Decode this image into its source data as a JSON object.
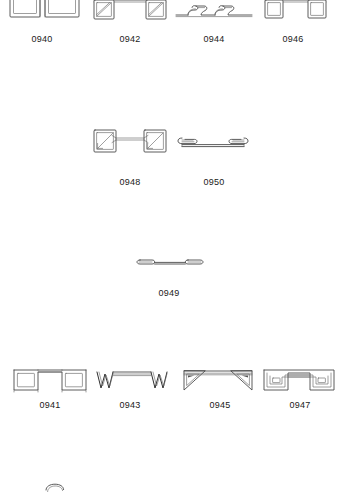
{
  "page": {
    "background_color": "#ffffff",
    "line_color": "#4a4a4a",
    "label_color": "#1a1a1a",
    "kind": "technical parts illustration sheet"
  },
  "rows": [
    {
      "row_name": "row-1",
      "figures": [
        {
          "id": "0940",
          "label": "0940",
          "icon": "double-rectangle-frame-bracket",
          "x": 8,
          "y": 0,
          "w": 70,
          "h": 22,
          "label_x": 20,
          "label_y": 34
        },
        {
          "id": "0942",
          "label": "0942",
          "icon": "diagonal-corner-brace-pair",
          "x": 92,
          "y": 0,
          "w": 74,
          "h": 22,
          "label_x": 108,
          "label_y": 34
        },
        {
          "id": "0944",
          "label": "0944",
          "icon": "s-hook-spring-strip",
          "x": 176,
          "y": 2,
          "w": 78,
          "h": 18,
          "label_x": 192,
          "label_y": 34
        },
        {
          "id": "0946",
          "label": "0946",
          "icon": "square-end-tie-bar",
          "x": 262,
          "y": 0,
          "w": 66,
          "h": 22,
          "label_x": 271,
          "label_y": 34
        }
      ]
    },
    {
      "row_name": "row-2",
      "figures": [
        {
          "id": "0948",
          "label": "0948",
          "icon": "arrow-corner-brace-pair",
          "x": 92,
          "y": 128,
          "w": 74,
          "h": 30,
          "label_x": 108,
          "label_y": 177
        },
        {
          "id": "0950",
          "label": "0950",
          "icon": "flat-curl-end-clip",
          "x": 178,
          "y": 134,
          "w": 68,
          "h": 18,
          "label_x": 192,
          "label_y": 177
        }
      ]
    },
    {
      "row_name": "row-3",
      "figures": [
        {
          "id": "0949",
          "label": "0949",
          "icon": "thin-rod-rounded-ends",
          "x": 132,
          "y": 258,
          "w": 74,
          "h": 12,
          "label_x": 137,
          "label_y": 288
        }
      ]
    },
    {
      "row_name": "row-4",
      "figures": [
        {
          "id": "0941",
          "label": "0941",
          "icon": "bridge-square-ends",
          "x": 12,
          "y": 366,
          "w": 72,
          "h": 26,
          "label_x": 28,
          "label_y": 400
        },
        {
          "id": "0943",
          "label": "0943",
          "icon": "w-zigzag-ends-bar",
          "x": 94,
          "y": 366,
          "w": 72,
          "h": 26,
          "label_x": 108,
          "label_y": 400
        },
        {
          "id": "0945",
          "label": "0945",
          "icon": "triangular-gusset-ends-bar",
          "x": 182,
          "y": 366,
          "w": 68,
          "h": 26,
          "label_x": 198,
          "label_y": 400
        },
        {
          "id": "0947",
          "label": "0947",
          "icon": "square-spiral-ends-bar",
          "x": 262,
          "y": 366,
          "w": 70,
          "h": 26,
          "label_x": 278,
          "label_y": 400
        }
      ]
    },
    {
      "row_name": "row-5-cut-off",
      "figures": [
        {
          "id": "partial",
          "label": "",
          "icon": "partial-clipped-shape",
          "x": 44,
          "y": 482,
          "w": 30,
          "h": 10,
          "label_x": 0,
          "label_y": 0
        }
      ]
    }
  ]
}
